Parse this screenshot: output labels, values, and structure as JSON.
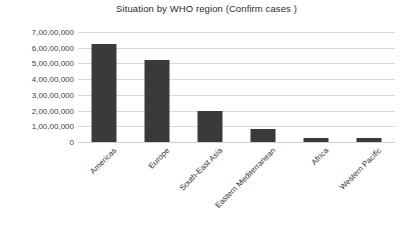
{
  "chart_data": {
    "type": "bar",
    "title": "Situation by WHO region (Confirm cases )",
    "xlabel": "",
    "ylabel": "",
    "categories": [
      "Americas",
      "Europe",
      "South-East Asia",
      "Eastern Mediterranean",
      "Africa",
      "Western Pacific"
    ],
    "values": [
      62500000,
      52000000,
      20000000,
      8500000,
      2500000,
      2500000
    ],
    "value_labels": [
      "6,25,00,000",
      "5,20,00,000",
      "2,00,00,000",
      "85,00,000",
      "25,00,000",
      "25,00,000"
    ],
    "ylim": [
      0,
      70000000
    ],
    "ytick_values": [
      70000000,
      60000000,
      50000000,
      40000000,
      30000000,
      20000000,
      10000000,
      0
    ],
    "ytick_labels": [
      "7,00,00,000",
      "6,00,00,000",
      "5,00,00,000",
      "4,00,00,000",
      "3,00,00,000",
      "2,00,00,000",
      "1,00,00,000",
      "0"
    ],
    "grid": true,
    "legend": false,
    "legend_position": "none",
    "bar_color": "#3a3a3a",
    "gridline_color": "#d9d9d9",
    "background_color": "#ffffff",
    "xtick_rotation": -45
  }
}
